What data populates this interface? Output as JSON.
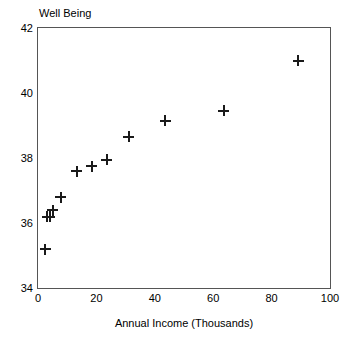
{
  "chart_data": {
    "type": "scatter",
    "title": "",
    "xlabel": "Annual Income (Thousands)",
    "ylabel": "Well Being",
    "xlim": [
      0,
      100
    ],
    "ylim": [
      34,
      42
    ],
    "xticks": [
      "0",
      "20",
      "40",
      "60",
      "80",
      "100"
    ],
    "xtick_values": [
      0,
      20,
      40,
      60,
      80,
      100
    ],
    "yticks": [
      "34",
      "36",
      "38",
      "40",
      "42"
    ],
    "ytick_values": [
      34,
      36,
      38,
      40,
      42
    ],
    "grid": false,
    "legend": false,
    "marker": "plus",
    "marker_color": "#1a1a1a",
    "frame_color": "#555555",
    "background": "#ffffff",
    "points": [
      {
        "x": 2.4,
        "y": 35.2
      },
      {
        "x": 3.1,
        "y": 36.2
      },
      {
        "x": 4.1,
        "y": 36.2
      },
      {
        "x": 5.1,
        "y": 36.4
      },
      {
        "x": 7.8,
        "y": 36.8
      },
      {
        "x": 13.3,
        "y": 37.6
      },
      {
        "x": 18.4,
        "y": 37.75
      },
      {
        "x": 23.5,
        "y": 37.95
      },
      {
        "x": 31.0,
        "y": 38.65
      },
      {
        "x": 43.5,
        "y": 39.15
      },
      {
        "x": 63.6,
        "y": 39.45
      },
      {
        "x": 89.1,
        "y": 41.0
      }
    ]
  }
}
